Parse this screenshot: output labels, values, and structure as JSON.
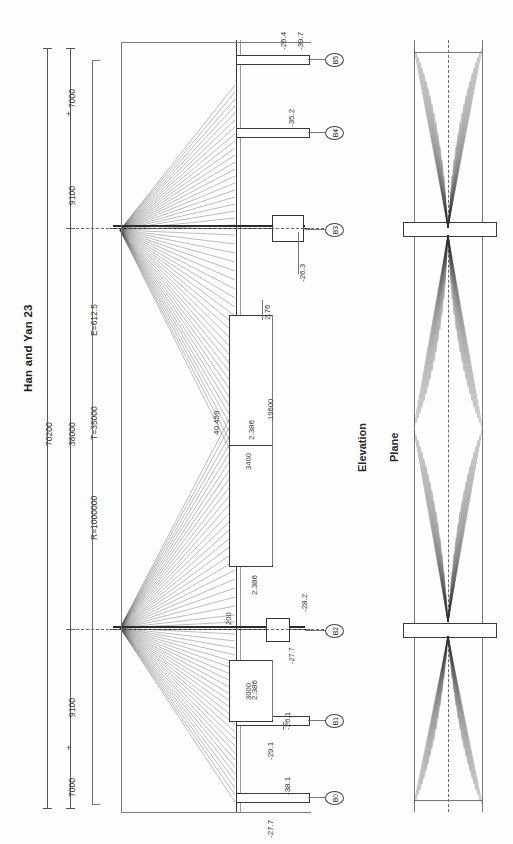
{
  "drawing": {
    "title": "Han and Yan  23",
    "views": {
      "elevation": "Elevation",
      "plan": "Plane"
    }
  },
  "dimensions": {
    "overall": "70200",
    "chain": [
      "7000",
      "9100",
      "38000",
      "9100",
      "7000"
    ],
    "curve": {
      "radius": "R=1000000",
      "tangent": "T=35000",
      "external": "E=612.5"
    },
    "deck_segments": [
      "19600",
      "3400",
      "3000"
    ],
    "misc": [
      "200"
    ]
  },
  "piers": [
    {
      "id": "B5"
    },
    {
      "id": "B4"
    },
    {
      "id": "B3"
    },
    {
      "id": "B2"
    },
    {
      "id": "B1"
    },
    {
      "id": "B0"
    }
  ],
  "levels": {
    "top_group": [
      "-26.4",
      "-39.7"
    ],
    "b4_group": [
      "-35.2"
    ],
    "b3_group": [
      "-26.3"
    ],
    "midspan": [
      "2.76",
      "2.386",
      "40.459"
    ],
    "b2_group": [
      "2.386",
      "-28.2",
      "-27.7"
    ],
    "b1_group": [
      "2.386",
      "-26.1"
    ],
    "bottom_group": [
      "-29.1",
      "-38.1",
      "-27.7"
    ]
  },
  "colors": {
    "ink": "#1b1b1b",
    "line": "#555555",
    "cable": "#3c3c3c",
    "paper": "#fefefe"
  }
}
